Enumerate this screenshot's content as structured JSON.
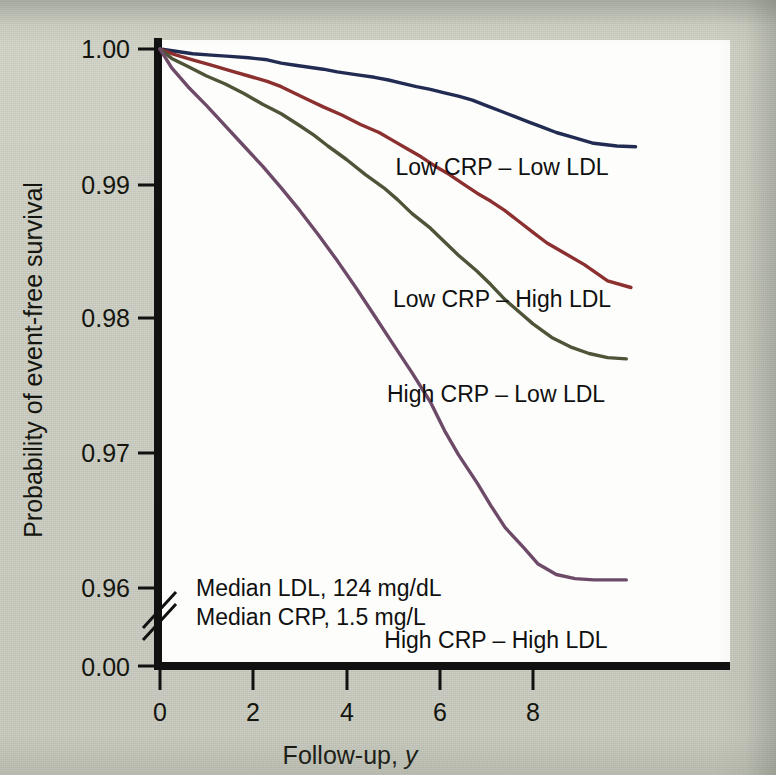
{
  "figure": {
    "background_color": "#c9cbbf",
    "plot_background_color": "#fdfdfb",
    "axis_color": "#111111"
  },
  "axes": {
    "y_title": "Probability of event-free survival",
    "x_title_main": "Follow-up, ",
    "x_title_italic": "y",
    "y_ticks": [
      "1.00",
      "0.99",
      "0.98",
      "0.97",
      "0.96",
      "0.00"
    ],
    "x_ticks": [
      "0",
      "2",
      "4",
      "6",
      "8"
    ],
    "axis_break": true
  },
  "annotations": {
    "median_ldl": "Median LDL, 124 mg/dL",
    "median_crp": "Median CRP, 1.5 mg/L"
  },
  "chart_data": {
    "type": "line",
    "title": "",
    "xlabel": "Follow-up, y",
    "ylabel": "Probability of event-free survival",
    "xlim": [
      0,
      12.2
    ],
    "ylim": [
      0.9555,
      1.0005
    ],
    "y_break": {
      "from": 0.9555,
      "to": 0.0,
      "label_at_bottom": "0.00"
    },
    "grid": false,
    "legend_position": "inline-right-of-curves",
    "x_tick_values": [
      0,
      2,
      4,
      6,
      8
    ],
    "y_tick_values": [
      1.0,
      0.99,
      0.98,
      0.97,
      0.96,
      0.0
    ],
    "series": [
      {
        "name": "Low CRP – Low LDL",
        "color": "#222c52",
        "label_color": "#101010",
        "x": [
          0,
          0.3,
          0.7,
          1.1,
          1.5,
          1.9,
          2.3,
          2.6,
          2.9,
          3.2,
          3.5,
          3.8,
          4.2,
          4.6,
          4.9,
          5.2,
          5.5,
          5.8,
          6.1,
          6.4,
          6.7,
          7.0,
          7.3,
          7.6,
          7.9,
          8.2,
          8.5,
          8.9,
          9.3,
          9.8,
          10.2
        ],
        "y": [
          1.0,
          0.99985,
          0.99965,
          0.99955,
          0.99945,
          0.99935,
          0.9992,
          0.99895,
          0.9988,
          0.99865,
          0.9985,
          0.9983,
          0.9981,
          0.9979,
          0.9977,
          0.99745,
          0.9972,
          0.997,
          0.99675,
          0.9965,
          0.9962,
          0.9958,
          0.9954,
          0.995,
          0.9946,
          0.9942,
          0.9938,
          0.9934,
          0.993,
          0.9928,
          0.99275
        ]
      },
      {
        "name": "Low CRP – High LDL",
        "color": "#8b2f2f",
        "label_color": "#101010",
        "x": [
          0,
          0.3,
          0.7,
          1.1,
          1.5,
          1.9,
          2.3,
          2.6,
          2.9,
          3.2,
          3.5,
          3.9,
          4.3,
          4.7,
          5.0,
          5.3,
          5.6,
          5.9,
          6.2,
          6.5,
          6.8,
          7.1,
          7.4,
          7.7,
          8.0,
          8.3,
          8.7,
          9.1,
          9.6,
          10.1
        ],
        "y": [
          1.0,
          0.9996,
          0.9992,
          0.9988,
          0.9984,
          0.998,
          0.9976,
          0.9972,
          0.9967,
          0.9962,
          0.9957,
          0.9951,
          0.9944,
          0.9938,
          0.9932,
          0.9926,
          0.992,
          0.9913,
          0.9907,
          0.99,
          0.9893,
          0.9887,
          0.988,
          0.9872,
          0.9864,
          0.9856,
          0.9848,
          0.984,
          0.9828,
          0.9823
        ]
      },
      {
        "name": "High CRP – Low LDL",
        "color": "#4d5437",
        "label_color": "#101010",
        "x": [
          0,
          0.25,
          0.6,
          1.0,
          1.4,
          1.8,
          2.2,
          2.6,
          3.0,
          3.3,
          3.6,
          4.0,
          4.4,
          4.8,
          5.1,
          5.4,
          5.8,
          6.1,
          6.4,
          6.8,
          7.1,
          7.4,
          7.7,
          8.0,
          8.4,
          8.8,
          9.2,
          9.6,
          10.0
        ],
        "y": [
          1.0,
          0.9993,
          0.9987,
          0.998,
          0.9974,
          0.9967,
          0.9959,
          0.9952,
          0.9943,
          0.9936,
          0.9928,
          0.9918,
          0.9907,
          0.9897,
          0.9888,
          0.9878,
          0.9867,
          0.9857,
          0.9847,
          0.9835,
          0.9825,
          0.9814,
          0.9805,
          0.9796,
          0.9786,
          0.9779,
          0.9774,
          0.9771,
          0.977
        ]
      },
      {
        "name": "High CRP – High LDL",
        "color": "#6d4a68",
        "label_color": "#101010",
        "x": [
          0,
          0.25,
          0.6,
          1.0,
          1.4,
          1.8,
          2.2,
          2.6,
          3.0,
          3.4,
          3.8,
          4.2,
          4.6,
          5.0,
          5.4,
          5.8,
          6.1,
          6.4,
          6.8,
          7.1,
          7.4,
          7.8,
          8.1,
          8.5,
          8.9,
          9.3,
          9.8,
          10.0
        ],
        "y": [
          1.0,
          0.9986,
          0.9972,
          0.9958,
          0.9943,
          0.9928,
          0.9913,
          0.9897,
          0.988,
          0.9862,
          0.9843,
          0.9823,
          0.9802,
          0.9781,
          0.976,
          0.9738,
          0.9717,
          0.9699,
          0.9678,
          0.9661,
          0.9645,
          0.963,
          0.9618,
          0.961,
          0.9607,
          0.9606,
          0.9606,
          0.9606
        ]
      }
    ],
    "series_label_positions": [
      {
        "name": "Low CRP – Low LDL",
        "x_px": 502,
        "y_px": 175
      },
      {
        "name": "Low CRP – High LDL",
        "x_px": 502,
        "y_px": 307
      },
      {
        "name": "High CRP – Low LDL",
        "x_px": 496,
        "y_px": 402
      },
      {
        "name": "High CRP – High LDL",
        "x_px": 496,
        "y_px": 648
      }
    ]
  }
}
